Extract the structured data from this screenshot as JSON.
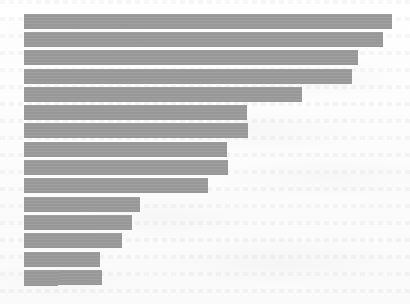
{
  "figure": {
    "background_color": "#fdfdfd",
    "bar_color": "#9a9a9a",
    "width_px": 410,
    "height_px": 304
  },
  "chart_data": {
    "type": "bar",
    "orientation": "horizontal",
    "title": "",
    "subtitle": "",
    "xlabel": "",
    "ylabel": "",
    "grid": false,
    "legend": false,
    "legend_position": "none",
    "annotations": [],
    "tick_labels_visible": false,
    "axis_lines_visible": false,
    "note": "Unlabeled horizontal bar chart: 16 bars sorted descending. No axis ticks, tick labels, legend, or title are rendered in the image. Values below are bar lengths measured in pixels from the common left baseline (x=24) to each bar's right edge.",
    "categories": [
      "bar-1",
      "bar-2",
      "bar-3",
      "bar-4",
      "bar-5",
      "bar-6",
      "bar-7",
      "bar-8",
      "bar-9",
      "bar-10",
      "bar-11",
      "bar-12",
      "bar-13",
      "bar-14",
      "bar-15",
      "bar-16"
    ],
    "values": [
      368,
      359,
      334,
      328,
      278,
      223,
      224,
      203,
      204,
      184,
      116,
      108,
      98,
      76,
      78,
      34
    ],
    "xlim": [
      0,
      386
    ],
    "ylim": [
      0,
      16
    ],
    "baseline_x_px": 24,
    "bar_right_edges_px": [
      392,
      383,
      358,
      352,
      302,
      247,
      248,
      227,
      228,
      208,
      140,
      132,
      122,
      100,
      102,
      58
    ],
    "bar_tops_px": [
      14,
      32,
      50,
      69,
      87,
      105,
      123,
      142,
      160,
      178,
      197,
      215,
      233,
      252,
      270,
      271
    ],
    "bar_height_px": 15,
    "bar_pitch_px": 18.3
  }
}
